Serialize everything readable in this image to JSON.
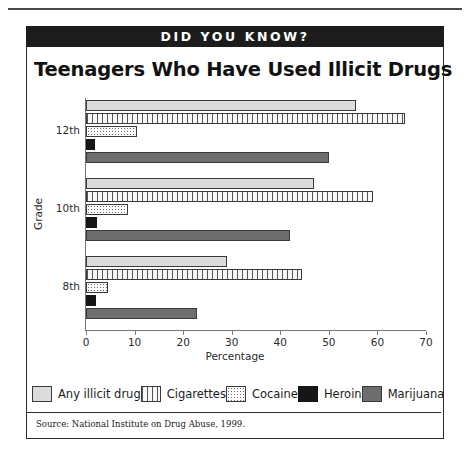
{
  "banner": {
    "label": "DID YOU KNOW?"
  },
  "chart_data": {
    "type": "bar",
    "orientation": "horizontal",
    "title": "Teenagers Who Have Used Illicit Drugs",
    "xlabel": "Percentage",
    "ylabel": "Grade",
    "xlim": [
      0,
      70
    ],
    "xticks": [
      0,
      10,
      20,
      30,
      40,
      50,
      60,
      70
    ],
    "xtick_labels": [
      "0",
      "10",
      "20",
      "30",
      "40",
      "50",
      "60",
      "70"
    ],
    "categories": [
      "12th",
      "10th",
      "8th"
    ],
    "grid": false,
    "legend_position": "bottom",
    "series": [
      {
        "name": "Any illicit drug",
        "pattern": "solid-light-gray",
        "color": "#dcdcdc",
        "values": [
          55.6,
          47.0,
          29.0
        ]
      },
      {
        "name": "Cigarettes",
        "pattern": "vertical-lines",
        "color": "#f7f7f7",
        "values": [
          65.6,
          59.0,
          44.5
        ]
      },
      {
        "name": "Cocaine",
        "pattern": "dotted",
        "color": "#fbfbfb",
        "values": [
          10.5,
          8.6,
          4.5
        ]
      },
      {
        "name": "Heroin",
        "pattern": "solid-black",
        "color": "#161616",
        "values": [
          1.9,
          2.3,
          2.0
        ]
      },
      {
        "name": "Marijuana",
        "pattern": "solid-dark-gray",
        "color": "#6e6e6e",
        "values": [
          50.0,
          42.0,
          22.9
        ]
      }
    ],
    "source": "Source:  National Institute on Drug Abuse, 1999."
  }
}
